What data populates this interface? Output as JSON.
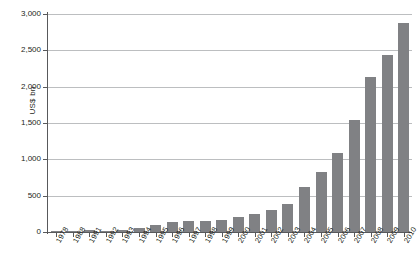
{
  "chart_data": {
    "type": "bar",
    "title": "",
    "xlabel": "",
    "ylabel": "US$ bn",
    "ylim": [
      0,
      3000
    ],
    "ytick_labels": [
      "0",
      "500",
      "1,000",
      "1,500",
      "2,000",
      "2,500",
      "3,000"
    ],
    "ytick_values": [
      0,
      500,
      1000,
      1500,
      2000,
      2500,
      3000
    ],
    "grid": true,
    "legend": null,
    "bar_color": "#808184",
    "axis_color": "#58595b",
    "gridline_color": "#bcbec0",
    "categories": [
      "1978",
      "1988",
      "1991",
      "1992",
      "1993",
      "1994",
      "1995",
      "1996",
      "1997",
      "1998",
      "1999",
      "2000",
      "2001",
      "2002",
      "2003",
      "2004",
      "2005",
      "2006",
      "2007",
      "2008",
      "2009",
      "2010"
    ],
    "values": [
      5,
      10,
      25,
      20,
      25,
      60,
      100,
      140,
      150,
      150,
      160,
      210,
      250,
      300,
      380,
      620,
      820,
      1090,
      1540,
      2130,
      2430,
      2880
    ],
    "series": [
      {
        "name": "US$ bn",
        "values": [
          5,
          10,
          25,
          20,
          25,
          60,
          100,
          140,
          150,
          150,
          160,
          210,
          250,
          300,
          380,
          620,
          820,
          1090,
          1540,
          2130,
          2430,
          2880
        ]
      }
    ]
  }
}
